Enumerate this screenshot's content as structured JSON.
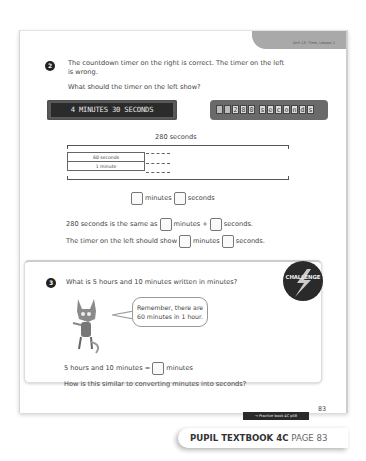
{
  "header": {
    "unit_label": "Unit 13: Time, Lesson 1"
  },
  "question2": {
    "number": "2",
    "text_line1": "The countdown timer on the right is correct. The timer on the left",
    "text_line2": "is wrong.",
    "prompt": "What should the timer on the left show?",
    "timer_left": "4 MINUTES 30 SECONDS",
    "timer_right_cells": [
      "",
      "",
      "2",
      "8",
      "0",
      " ",
      "s",
      "e",
      "c",
      "o",
      "n",
      "d",
      "s"
    ],
    "bar_model": {
      "total_label": "280 seconds",
      "row1": "60 seconds",
      "row2": "1 minute"
    },
    "answer_row": {
      "minutes": "minutes",
      "seconds": "seconds"
    },
    "sentence1": {
      "a": "280 seconds is the same as",
      "b": "minutes +",
      "c": "seconds."
    },
    "sentence2": {
      "a": "The timer on the left should show",
      "b": "minutes",
      "c": "seconds."
    }
  },
  "question3": {
    "number": "3",
    "text": "What is 5 hours and 10 minutes written in minutes?",
    "badge": "CHALLENGE",
    "speech": {
      "line1": "Remember, there are",
      "line2": "60 minutes in 1 hour."
    },
    "equation": {
      "a": "5 hours and 10 minutes =",
      "b": "minutes"
    },
    "followup": "How is this similar to converting minutes into seconds?"
  },
  "page_number": "83",
  "practice_link": "→ Practice book 4C p58",
  "footer": {
    "book": "PUPIL TEXTBOOK 4C",
    "page": "PAGE 83"
  }
}
